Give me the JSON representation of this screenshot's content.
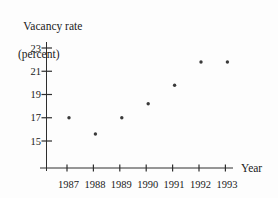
{
  "chart_data": {
    "type": "scatter",
    "title_line1": "Vacancy rate",
    "title_line2": "(percent)",
    "xlabel": "Year",
    "ylabel": "Vacancy rate (percent)",
    "x": [
      1987,
      1988,
      1989,
      1990,
      1991,
      1992,
      1993
    ],
    "values": [
      17.0,
      15.6,
      17.0,
      18.2,
      19.8,
      21.8,
      21.8
    ],
    "x_ticks": [
      "1987",
      "1988",
      "1989",
      "1990",
      "1991",
      "1992",
      "1993"
    ],
    "y_ticks": [
      15,
      17,
      19,
      21,
      23
    ],
    "ylim": [
      13.8,
      23.6
    ],
    "grid": false,
    "legend": "none",
    "point_color": "#3a3a3a",
    "axis_color": "#2e2e2e",
    "text_color": "#1a1a1a",
    "background_color": "#fdfdfd"
  }
}
